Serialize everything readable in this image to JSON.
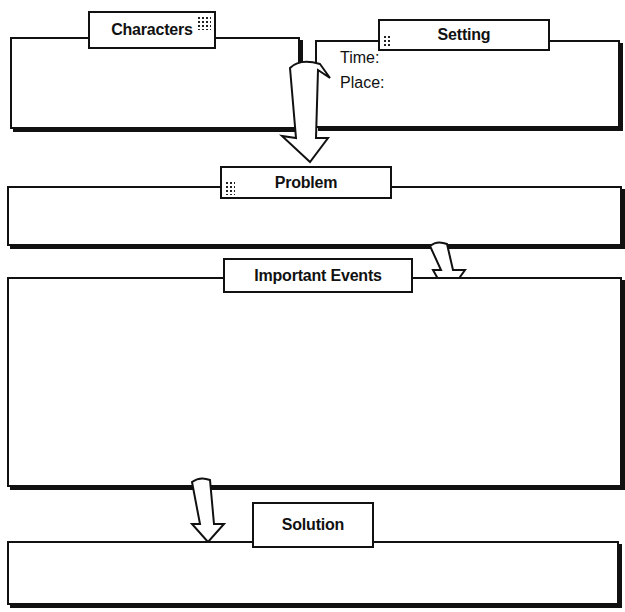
{
  "sections": {
    "characters": {
      "label": "Characters"
    },
    "setting": {
      "label": "Setting",
      "fields": {
        "time": "Time:",
        "place": "Place:"
      }
    },
    "problem": {
      "label": "Problem"
    },
    "events": {
      "label": "Important Events"
    },
    "solution": {
      "label": "Solution"
    }
  },
  "colors": {
    "ink": "#111111",
    "paper": "#ffffff"
  }
}
